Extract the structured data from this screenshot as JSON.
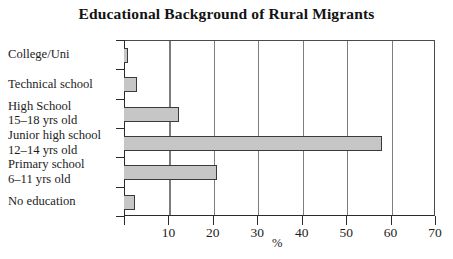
{
  "chart_data": {
    "type": "bar",
    "orientation": "horizontal",
    "title": "Educational Background of Rural Migrants",
    "xlabel": "%",
    "ylabel": "",
    "xlim": [
      0,
      70
    ],
    "xticks": [
      10,
      20,
      30,
      40,
      50,
      60,
      70
    ],
    "xtick_labels": [
      "10",
      "20",
      "30",
      "40",
      "50",
      "60",
      "70"
    ],
    "grid": "vertical",
    "legend": "none",
    "bar_fill_color": "#c6c6c6",
    "bar_edge_color": "#3a3a3a",
    "axis_color": "#2b2b2b",
    "gridline_color": "#7d7d7d",
    "categories": [
      "College/Uni",
      "Technical school",
      "High School 15–18 yrs old",
      "Junior high school 12–14 yrs old",
      "Primary school 6–11 yrs old",
      "No education"
    ],
    "category_lines": [
      [
        "College/Uni"
      ],
      [
        "Technical school"
      ],
      [
        "High School",
        "15–18 yrs old"
      ],
      [
        "Junior high school",
        "12–14 yrs old"
      ],
      [
        "Primary school",
        "6–11 yrs old"
      ],
      [
        "No education"
      ]
    ],
    "values": [
      1,
      3,
      12.3,
      58,
      21,
      2.5
    ]
  }
}
